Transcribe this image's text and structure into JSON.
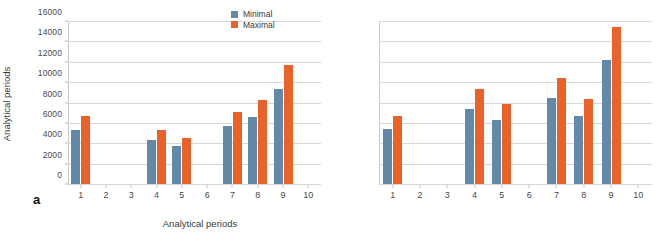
{
  "figure": {
    "panels": [
      {
        "tag": "a",
        "show_y_ticks": true,
        "show_x_label": true
      },
      {
        "tag": "b",
        "show_y_ticks": false,
        "show_x_label": false
      }
    ],
    "legend": {
      "position": "top-right",
      "entries": [
        {
          "label": "Minimal",
          "color": "#6389a8"
        },
        {
          "label": "Maximal",
          "color": "#e8622a"
        }
      ]
    },
    "colors": {
      "minimal": "#6389a8",
      "maximal": "#e8622a",
      "gridline": "#d8d8d8",
      "axis": "#b9b9b9",
      "text": "#3a3a3a",
      "background": "#ffffff"
    }
  },
  "chart_data": [
    {
      "type": "bar",
      "panel": "a",
      "title": "",
      "xlabel": "Analytical periods",
      "ylabel": "Analytical periods",
      "categories": [
        "1",
        "2",
        "3",
        "4",
        "5",
        "6",
        "7",
        "8",
        "9",
        "10"
      ],
      "ylim": [
        0,
        16000
      ],
      "yticks": [
        0,
        2000,
        4000,
        6000,
        8000,
        10000,
        12000,
        14000,
        16000
      ],
      "grid": true,
      "legend_position": "top-right",
      "series": [
        {
          "name": "Minimal",
          "color": "#6389a8",
          "values": [
            5350,
            null,
            null,
            4280,
            3700,
            null,
            5700,
            6550,
            9350,
            null
          ]
        },
        {
          "name": "Maximal",
          "color": "#e8622a",
          "values": [
            6650,
            null,
            null,
            5330,
            4550,
            null,
            7070,
            8220,
            11700,
            null
          ]
        }
      ]
    },
    {
      "type": "bar",
      "panel": "b",
      "title": "",
      "xlabel": "",
      "ylabel": "",
      "categories": [
        "1",
        "2",
        "3",
        "4",
        "5",
        "6",
        "7",
        "8",
        "9",
        "10"
      ],
      "ylim": [
        0,
        16000
      ],
      "yticks": [
        0,
        2000,
        4000,
        6000,
        8000,
        10000,
        12000,
        14000,
        16000
      ],
      "grid": true,
      "legend_position": "shared",
      "series": [
        {
          "name": "Minimal",
          "color": "#6389a8",
          "values": [
            5400,
            null,
            null,
            7400,
            6250,
            null,
            8400,
            6650,
            12200,
            null
          ]
        },
        {
          "name": "Maximal",
          "color": "#e8622a",
          "values": [
            6700,
            null,
            null,
            9300,
            7850,
            null,
            10450,
            8300,
            15400,
            null
          ]
        }
      ]
    }
  ]
}
